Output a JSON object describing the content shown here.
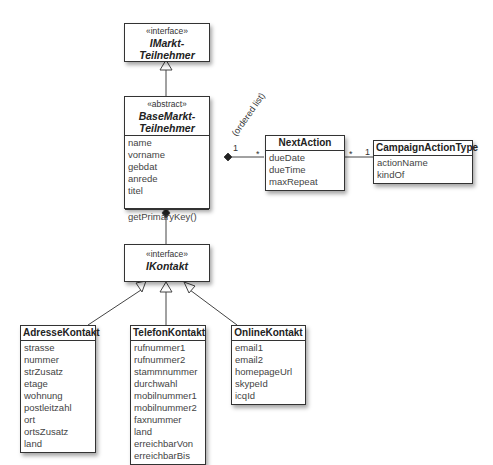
{
  "classes": {
    "imarkt": {
      "stereotype": "«interface»",
      "name_line1": "IMarkt-",
      "name_line2": "Teilnehmer"
    },
    "base": {
      "stereotype": "«abstract»",
      "name_line1": "BaseMarkt-",
      "name_line2": "Teilnehmer",
      "attributes": [
        "name",
        "vorname",
        "gebdat",
        "anrede",
        "titel"
      ],
      "operations": [
        "getPrimaryKey()"
      ]
    },
    "nextaction": {
      "name": "NextAction",
      "attributes": [
        "dueDate",
        "dueTime",
        "maxRepeat"
      ]
    },
    "campaign": {
      "name": "CampaignActionType",
      "attributes": [
        "actionName",
        "kindOf"
      ]
    },
    "ikontakt": {
      "stereotype": "«interface»",
      "name": "IKontakt"
    },
    "adresse": {
      "name": "AdresseKontakt",
      "attributes": [
        "strasse",
        "nummer",
        "strZusatz",
        "etage",
        "wohnung",
        "postleitzahl",
        "ort",
        "ortsZusatz",
        "land"
      ]
    },
    "telefon": {
      "name": "TelefonKontakt",
      "attributes": [
        "rufnummer1",
        "rufnummer2",
        "stammnummer",
        "durchwahl",
        "mobilnummer1",
        "mobilnummer2",
        "faxnummer",
        "land",
        "erreichbarVon",
        "erreichbarBis"
      ]
    },
    "online": {
      "name": "OnlineKontakt",
      "attributes": [
        "email1",
        "email2",
        "homepageUrl",
        "skypeId",
        "icqId"
      ]
    }
  },
  "associations": {
    "base_next": {
      "source_mult": "1",
      "target_mult": "*",
      "label": "(ordered list)"
    },
    "next_campaign": {
      "source_mult": "*",
      "target_mult": "1"
    }
  }
}
